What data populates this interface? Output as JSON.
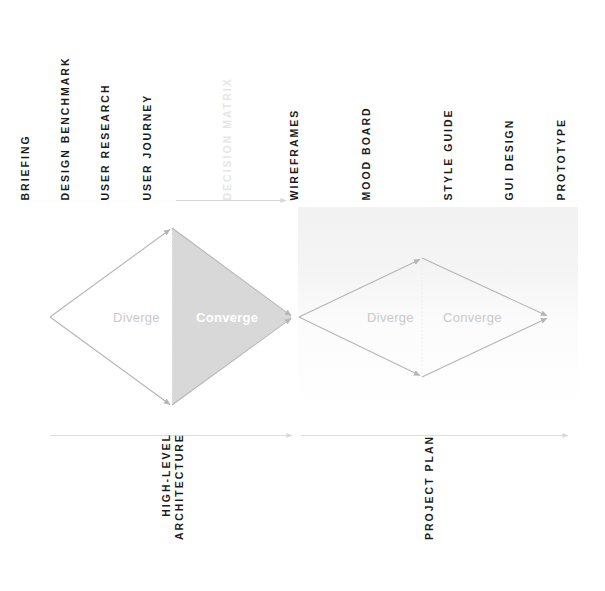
{
  "diagram": {
    "colors": {
      "label_dark": "#1b1b1b",
      "label_muted": "#e6e6e6",
      "stroke_gray": "#b9b9b9",
      "fill_gray": "#d8d8d8",
      "diamond_text": "#c9c9c9",
      "converge_text_filled": "#ffffff",
      "band": "#f2f2f2"
    },
    "top_labels": [
      {
        "text": "BRIEFING",
        "muted": false
      },
      {
        "text": "DESIGN BENCHMARK",
        "muted": false
      },
      {
        "text": "USER RESEARCH",
        "muted": false
      },
      {
        "text": "USER JOURNEY",
        "muted": false
      },
      {
        "text": "DECISION MATRIX",
        "muted": true
      },
      {
        "text": "WIREFRAMES",
        "muted": false
      },
      {
        "text": "MOOD BOARD",
        "muted": false
      },
      {
        "text": "STYLE GUIDE",
        "muted": false
      },
      {
        "text": "GUI DESIGN",
        "muted": false
      },
      {
        "text": "PROTOTYPE",
        "muted": false
      }
    ],
    "bottom_labels": [
      {
        "line1": "HIGH-LEVEL",
        "line2": "ARCHITECTURE"
      },
      {
        "line1": "PROJECT PLAN",
        "line2": ""
      }
    ],
    "diamonds": [
      {
        "name": "discover-define",
        "diverge_label": "Diverge",
        "converge_label": "Converge",
        "converge_filled": true
      },
      {
        "name": "develop-deliver",
        "diverge_label": "Diverge",
        "converge_label": "Converge",
        "converge_filled": false
      }
    ]
  }
}
